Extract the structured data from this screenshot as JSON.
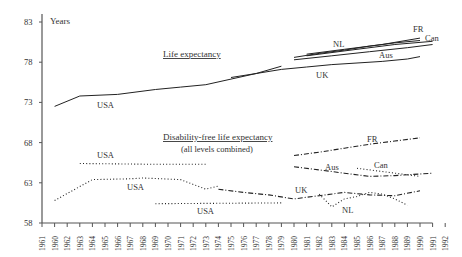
{
  "chart_data": {
    "type": "line",
    "ylabel": "Years",
    "yticks": [
      58,
      63,
      68,
      73,
      78,
      83
    ],
    "ylim": [
      58,
      83
    ],
    "xtick_labels": [
      "1961",
      "1960",
      "1962",
      "1963",
      "1964",
      "1965",
      "1966",
      "1967",
      "1968",
      "1969",
      "1970",
      "1971",
      "1972",
      "1973",
      "1974",
      "1975",
      "1976",
      "1977",
      "1978",
      "1979",
      "1980",
      "1981",
      "1982",
      "1983",
      "1984",
      "1985",
      "1986",
      "1987",
      "1988",
      "1989",
      "1990",
      "1991",
      "1992"
    ],
    "annotations": {
      "life_title": "Life expectancy",
      "dfle_title": "Disability-free life expectancy",
      "dfle_subtitle": "(all levels combined)"
    },
    "series": [
      {
        "name": "USA",
        "group": "life",
        "style": "solid",
        "x": [
          1962,
          1964,
          1967,
          1970,
          1972,
          1974,
          1976,
          1978,
          1980
        ],
        "values": [
          72.5,
          73.8,
          74.0,
          74.6,
          74.9,
          75.2,
          75.9,
          76.6,
          77.5
        ]
      },
      {
        "name": "UK",
        "group": "life",
        "style": "solid",
        "x": [
          1976,
          1978,
          1980,
          1982,
          1984,
          1986,
          1988,
          1990,
          1991
        ],
        "values": [
          76.1,
          76.6,
          77.1,
          77.4,
          77.7,
          77.9,
          78.1,
          78.4,
          78.7
        ]
      },
      {
        "name": "NL",
        "group": "life",
        "style": "solid",
        "x": [
          1981,
          1983,
          1985,
          1987,
          1989,
          1991
        ],
        "values": [
          78.6,
          79.1,
          79.5,
          80.0,
          80.4,
          80.7
        ]
      },
      {
        "name": "FR",
        "group": "life",
        "style": "solid",
        "x": [
          1982,
          1985,
          1988,
          1991
        ],
        "values": [
          79.0,
          79.6,
          80.2,
          81.0
        ]
      },
      {
        "name": "Can",
        "group": "life",
        "style": "solid",
        "x": [
          1982,
          1986,
          1989,
          1992
        ],
        "values": [
          78.8,
          79.6,
          80.2,
          80.6
        ]
      },
      {
        "name": "Aus",
        "group": "life",
        "style": "solid",
        "x": [
          1981,
          1984,
          1987,
          1990,
          1992
        ],
        "values": [
          78.3,
          78.8,
          79.3,
          79.8,
          80.2
        ]
      },
      {
        "name": "USA",
        "group": "dfle",
        "style": "dotted",
        "x": [
          1964,
          1970,
          1974
        ],
        "values": [
          65.4,
          65.3,
          65.3
        ]
      },
      {
        "name": "USA",
        "group": "dfle",
        "style": "dotted",
        "x": [
          1962,
          1965,
          1968,
          1969,
          1972,
          1973,
          1974,
          1975
        ],
        "values": [
          60.8,
          63.4,
          63.5,
          63.6,
          63.4,
          62.8,
          62.2,
          62.6
        ]
      },
      {
        "name": "USA",
        "group": "dfle",
        "style": "dotted",
        "x": [
          1970,
          1980
        ],
        "values": [
          60.4,
          60.5
        ]
      },
      {
        "name": "UK",
        "group": "dfle",
        "style": "dashdot",
        "x": [
          1975,
          1977,
          1979,
          1981,
          1983,
          1985,
          1987,
          1989,
          1991
        ],
        "values": [
          62.2,
          61.8,
          61.5,
          61.0,
          61.4,
          61.8,
          61.5,
          61.4,
          62.0
        ]
      },
      {
        "name": "FR",
        "group": "dfle",
        "style": "dashdot",
        "x": [
          1981,
          1983,
          1985,
          1987,
          1989,
          1991
        ],
        "values": [
          66.4,
          66.8,
          67.3,
          67.8,
          68.2,
          68.6
        ]
      },
      {
        "name": "Aus",
        "group": "dfle",
        "style": "dashdot",
        "x": [
          1981,
          1983,
          1985,
          1987,
          1989,
          1992
        ],
        "values": [
          65.0,
          64.6,
          64.2,
          63.8,
          63.9,
          64.2
        ]
      },
      {
        "name": "Can",
        "group": "dfle",
        "style": "dotted",
        "x": [
          1986,
          1988,
          1990,
          1991
        ],
        "values": [
          64.8,
          64.4,
          64.0,
          63.8
        ]
      },
      {
        "name": "NL",
        "group": "dfle",
        "style": "dotted",
        "x": [
          1983,
          1984,
          1985,
          1986,
          1987,
          1988,
          1989,
          1990
        ],
        "values": [
          61.6,
          60.0,
          61.0,
          61.3,
          61.8,
          61.6,
          61.0,
          60.2
        ]
      }
    ],
    "labels": [
      {
        "text": "USA",
        "x": 97,
        "y": 108
      },
      {
        "text": "UK",
        "x": 316,
        "y": 78
      },
      {
        "text": "NL",
        "x": 333,
        "y": 47
      },
      {
        "text": "FR",
        "x": 413,
        "y": 32
      },
      {
        "text": "Can",
        "x": 425,
        "y": 41
      },
      {
        "text": "Aus",
        "x": 379,
        "y": 58
      },
      {
        "text": "USA",
        "x": 97,
        "y": 158
      },
      {
        "text": "USA",
        "x": 127,
        "y": 190
      },
      {
        "text": "USA",
        "x": 197,
        "y": 214
      },
      {
        "text": "UK",
        "x": 295,
        "y": 193
      },
      {
        "text": "FR",
        "x": 367,
        "y": 142
      },
      {
        "text": "Aus",
        "x": 325,
        "y": 170
      },
      {
        "text": "Can",
        "x": 374,
        "y": 168
      },
      {
        "text": "NL",
        "x": 342,
        "y": 213
      }
    ]
  }
}
